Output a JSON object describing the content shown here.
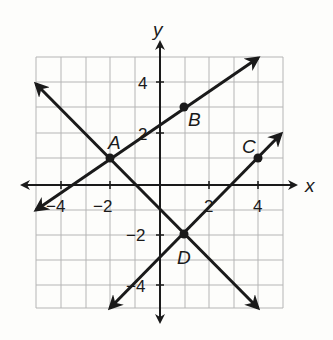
{
  "graph": {
    "axes": {
      "x_label": "x",
      "y_label": "y",
      "range": [
        -5,
        5
      ],
      "x_ticks": [
        {
          "value": -4,
          "label": "−4"
        },
        {
          "value": -2,
          "label": "−2"
        },
        {
          "value": 2,
          "label": "2"
        },
        {
          "value": 4,
          "label": "4"
        }
      ],
      "y_ticks": [
        {
          "value": 4,
          "label": "4"
        },
        {
          "value": 2,
          "label": "2"
        },
        {
          "value": -2,
          "label": "−2"
        },
        {
          "value": -4,
          "label": "−4"
        }
      ]
    },
    "points": [
      {
        "name": "A",
        "x": -2,
        "y": 1
      },
      {
        "name": "B",
        "x": 1,
        "y": 3
      },
      {
        "name": "C",
        "x": 4,
        "y": 1
      },
      {
        "name": "D",
        "x": 1,
        "y": -2
      }
    ],
    "lines": [
      {
        "name": "line-AB",
        "from": [
          -5,
          -1
        ],
        "to": [
          4,
          5
        ]
      },
      {
        "name": "line-AD",
        "from": [
          -5,
          4
        ],
        "to": [
          4,
          -5
        ]
      },
      {
        "name": "line-CD",
        "from": [
          -2,
          -5
        ],
        "to": [
          5,
          2
        ]
      }
    ],
    "colors": {
      "line": "#1a1a1a",
      "grid": "#b5b5b5",
      "background": "#fdfdfb"
    }
  }
}
